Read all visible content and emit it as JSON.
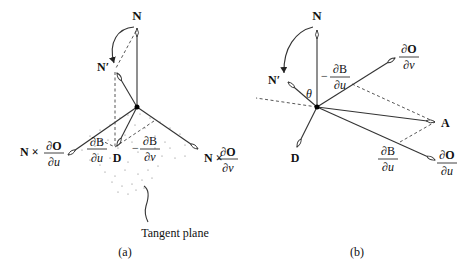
{
  "figure_a": {
    "caption": "(a)",
    "labels": {
      "normal": "N",
      "normal_prime": "N′",
      "n_cross_du_prefix": "N ×",
      "n_cross_dv_prefix": "N ×",
      "dO": "∂O",
      "du": "∂u",
      "dv": "∂v",
      "dB": "∂B",
      "displacement": "D",
      "minus": "−",
      "tangent_plane": "Tangent plane"
    }
  },
  "figure_b": {
    "caption": "(b)",
    "labels": {
      "normal": "N",
      "normal_prime": "N′",
      "theta": "θ",
      "dO": "∂O",
      "dv": "∂v",
      "du": "∂u",
      "dB": "∂B",
      "minus": "−",
      "point_a": "A",
      "displacement": "D"
    }
  },
  "colors": {
    "line": "#333333",
    "text": "#111111",
    "background": "#ffffff"
  }
}
